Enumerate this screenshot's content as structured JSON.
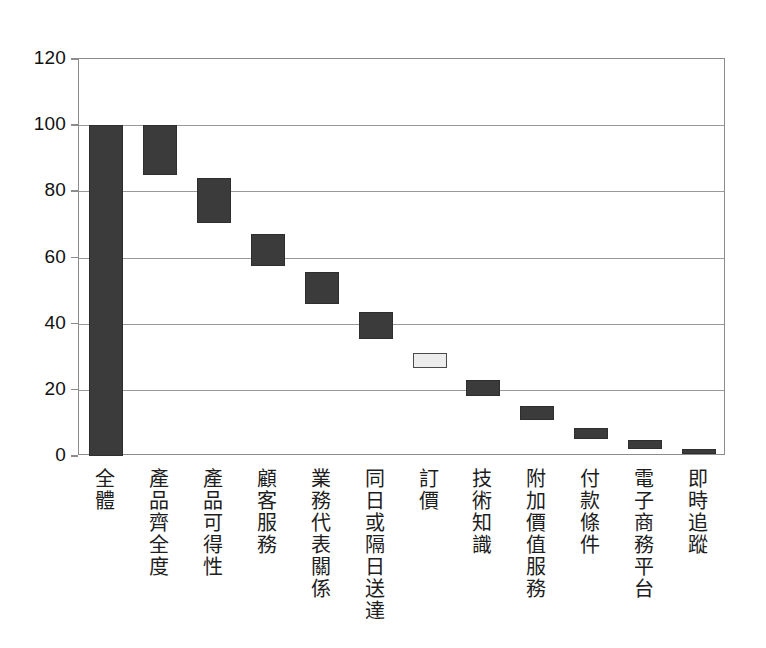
{
  "chart_data": {
    "type": "bar",
    "chart_variant": "waterfall",
    "title": "",
    "subtitle": "",
    "xlabel": "",
    "ylabel": "",
    "ylim": [
      0,
      120
    ],
    "ytick_values": [
      0,
      20,
      40,
      60,
      80,
      100,
      120
    ],
    "ytick_labels": [
      "0",
      "20",
      "40",
      "60",
      "80",
      "100",
      "120"
    ],
    "grid": true,
    "grid_axis": "y",
    "legend": null,
    "legend_position": "none",
    "categories": [
      "全體",
      "產品齊全度",
      "產品可得性",
      "顧客服務",
      "業務代表關係",
      "同日或隔日送達",
      "訂價",
      "技術知識",
      "附加價值服務",
      "付款條件",
      "電子商務平台",
      "即時追蹤"
    ],
    "series": [
      {
        "name": "累積重要度",
        "bar_tops": [
          100,
          100,
          84,
          67,
          55.5,
          43.5,
          31,
          23,
          15,
          8.5,
          5,
          2
        ],
        "bar_bottoms": [
          0,
          85,
          70.5,
          57.5,
          46,
          35.5,
          26.5,
          18,
          11,
          5,
          2,
          0.5
        ],
        "values": [
          100,
          15,
          13.5,
          9.5,
          9.5,
          8,
          4.5,
          5,
          4,
          3.5,
          3,
          1.5
        ]
      }
    ],
    "highlight_index": 6,
    "colors": {
      "bar_dark": "#3b3b3b",
      "bar_highlight_fill": "#ededed",
      "bar_highlight_border": "#4a4a4a",
      "gridline": "#999999",
      "axis": "#8c8c8c",
      "background": "#ffffff",
      "text": "#1d1d1d"
    }
  }
}
